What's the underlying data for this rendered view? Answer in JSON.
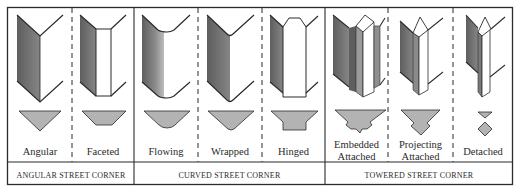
{
  "figure": {
    "colors": {
      "frame": "#2b2b2b",
      "dark_face": "#6e6e6e",
      "mid_face": "#9a9a9a",
      "light_face": "#c8c8c8",
      "plan_fill": "#b3b3b3",
      "line": "#2b2b2b",
      "background": "#ffffff"
    },
    "columns": [
      {
        "id": "angular",
        "label_lines": [
          "Angular"
        ],
        "group": "angular"
      },
      {
        "id": "faceted",
        "label_lines": [
          "Faceted"
        ],
        "group": "angular"
      },
      {
        "id": "flowing",
        "label_lines": [
          "Flowing"
        ],
        "group": "curved"
      },
      {
        "id": "wrapped",
        "label_lines": [
          "Wrapped"
        ],
        "group": "curved"
      },
      {
        "id": "hinged",
        "label_lines": [
          "Hinged"
        ],
        "group": "curved"
      },
      {
        "id": "embedded-attached",
        "label_lines": [
          "Embedded",
          "Attached"
        ],
        "group": "towered"
      },
      {
        "id": "projecting-attached",
        "label_lines": [
          "Projecting",
          "Attached"
        ],
        "group": "towered"
      },
      {
        "id": "detached",
        "label_lines": [
          "Detached"
        ],
        "group": "towered"
      }
    ],
    "groups": [
      {
        "id": "angular",
        "label": "ANGULAR STREET CORNER"
      },
      {
        "id": "curved",
        "label": "CURVED STREET CORNER"
      },
      {
        "id": "towered",
        "label": "TOWERED STREET CORNER"
      }
    ]
  }
}
